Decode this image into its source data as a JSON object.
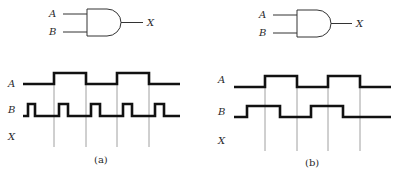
{
  "figure": {
    "panels": [
      {
        "id": "a",
        "caption": "(a)",
        "gate": {
          "type": "AND",
          "inputs": [
            "A",
            "B"
          ],
          "output": "X"
        },
        "timing": {
          "signal_labels": [
            "A",
            "B",
            "X"
          ],
          "A": {
            "description": "square wave, period = 2 units",
            "levels": [
              0,
              1,
              0,
              1,
              0
            ]
          },
          "B": {
            "description": "narrow pulses, 5 pulses",
            "pulse_count": 5
          },
          "X": {
            "description": "output to be determined",
            "levels": []
          }
        }
      },
      {
        "id": "b",
        "caption": "(b)",
        "gate": {
          "type": "AND",
          "inputs": [
            "A",
            "B"
          ],
          "output": "X"
        },
        "timing": {
          "signal_labels": [
            "A",
            "B",
            "X"
          ],
          "A": {
            "description": "square wave",
            "levels": [
              0,
              1,
              0,
              1,
              0
            ]
          },
          "B": {
            "description": "square wave, phase-shifted earlier than A",
            "levels": [
              0,
              1,
              0,
              1,
              0
            ]
          },
          "X": {
            "description": "output to be determined",
            "levels": []
          }
        }
      }
    ]
  },
  "labels": {
    "a": {
      "gate_A": "A",
      "gate_B": "B",
      "gate_X": "X",
      "wave_A": "A",
      "wave_B": "B",
      "wave_X": "X",
      "caption": "(a)"
    },
    "b": {
      "gate_A": "A",
      "gate_B": "B",
      "gate_X": "X",
      "wave_A": "A",
      "wave_B": "B",
      "wave_X": "X",
      "caption": "(b)"
    }
  }
}
